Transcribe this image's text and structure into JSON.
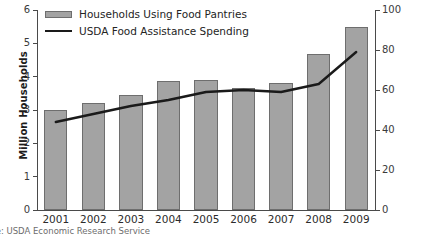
{
  "chart_data": {
    "type": "bar",
    "title": "",
    "xlabel": "",
    "ylabel": "Million Households",
    "y2label": "Billions of 2009 Dollars",
    "categories": [
      "2001",
      "2002",
      "2003",
      "2004",
      "2005",
      "2006",
      "2007",
      "2008",
      "2009"
    ],
    "ylim": [
      0,
      6
    ],
    "y2lim": [
      0,
      100
    ],
    "yticks": [
      "0",
      "1",
      "2",
      "3",
      "4",
      "5",
      "6"
    ],
    "y2ticks": [
      "0",
      "20",
      "40",
      "60",
      "80",
      "100"
    ],
    "grid": false,
    "legend_position": "top-left-inside",
    "series": [
      {
        "name": "Households Using Food Pantries",
        "type": "bar",
        "axis": "left",
        "units": "Million Households",
        "color": "#a3a3a3",
        "edge_color": "#6e6e6e",
        "values": [
          3.0,
          3.2,
          3.45,
          3.87,
          3.9,
          3.65,
          3.82,
          4.67,
          5.48
        ]
      },
      {
        "name": "USDA Food Assistance Spending",
        "type": "line",
        "axis": "right",
        "units": "Billions of 2009 Dollars",
        "color": "#1a1a1a",
        "values": [
          44,
          48,
          52,
          55,
          59,
          60,
          59,
          63,
          79
        ]
      }
    ],
    "annotations": []
  },
  "legend": {
    "items": [
      {
        "label": "Households Using Food Pantries",
        "glyph": "bar-swatch"
      },
      {
        "label": "USDA Food Assistance Spending",
        "glyph": "line-swatch"
      }
    ]
  },
  "footer": {
    "source_note": "ce: USDA Economic Research Service"
  }
}
